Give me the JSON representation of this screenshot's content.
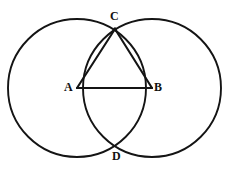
{
  "figure": {
    "background_color": "#ffffff",
    "stroke_color": "#141414",
    "label_color": "#111111",
    "width": 229,
    "height": 171
  },
  "labels": {
    "c": "C",
    "a": "A",
    "b": "B",
    "d": "D"
  },
  "chart_data": {
    "type": "diagram",
    "xlabel": "",
    "ylabel": "",
    "xlim": [
      0,
      229
    ],
    "ylim": [
      0,
      171
    ],
    "grid": false,
    "legend": "none",
    "points": [
      {
        "name": "A",
        "label": "A",
        "x": 77,
        "y": 88,
        "role": "center-of-left-circle"
      },
      {
        "name": "B",
        "label": "B",
        "x": 152,
        "y": 88,
        "role": "center-of-right-circle"
      },
      {
        "name": "C",
        "label": "C",
        "x": 115,
        "y": 29,
        "role": "upper-intersection"
      },
      {
        "name": "D",
        "label": "D",
        "x": 116,
        "y": 147,
        "role": "lower-intersection"
      }
    ],
    "circles": [
      {
        "name": "left-circle",
        "cx": 77,
        "cy": 88,
        "r": 69
      },
      {
        "name": "right-circle",
        "cx": 152,
        "cy": 88,
        "r": 69
      }
    ],
    "segments": [
      {
        "name": "segment-ab",
        "from": "A",
        "to": "B",
        "x1": 77,
        "y1": 88,
        "x2": 152,
        "y2": 88
      },
      {
        "name": "segment-ac",
        "from": "A",
        "to": "C",
        "x1": 77,
        "y1": 88,
        "x2": 115,
        "y2": 29
      },
      {
        "name": "segment-bc",
        "from": "B",
        "to": "C",
        "x1": 152,
        "y1": 88,
        "x2": 115,
        "y2": 29
      }
    ]
  }
}
